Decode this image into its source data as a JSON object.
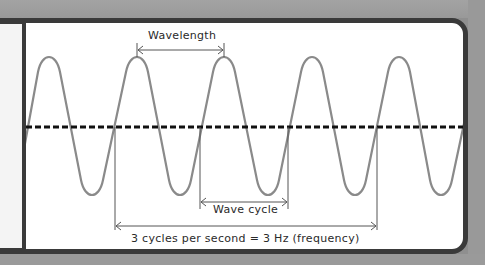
{
  "diagram": {
    "labels": {
      "wavelength": "Wavelength",
      "wave_cycle": "Wave cycle",
      "frequency": "3 cycles per second = 3 Hz (frequency)"
    },
    "wave": {
      "peaks_x": [
        49,
        137,
        224,
        312,
        399
      ],
      "troughs_x": [
        92,
        180,
        268,
        355,
        441
      ],
      "peak_y": 56,
      "trough_y": 196,
      "midline_y": 127,
      "period_px": 87.5,
      "cycles_marked": 3,
      "frequency_hz": 3
    },
    "colors": {
      "wave": "#8a8a8a",
      "midline": "#111111",
      "frame": "#3a3a3a",
      "background": "#999999",
      "text": "#2a2a2a"
    }
  }
}
